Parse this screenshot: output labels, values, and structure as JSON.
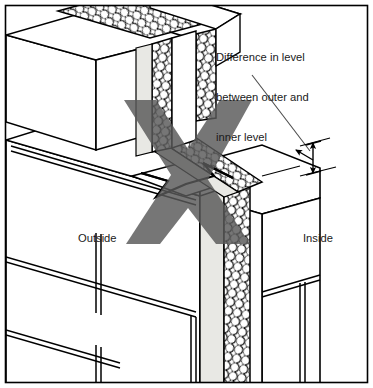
{
  "figure": {
    "width": 373,
    "height": 388,
    "background": "#ffffff",
    "border_color": "#000000",
    "type": "isometric-construction-detail"
  },
  "annotations": {
    "callout": {
      "name": "difference-in-level-callout",
      "lines": [
        "Difference in level",
        "between outer and",
        "inner level"
      ],
      "full_text": "Difference in level between outer and inner level"
    },
    "outside_label": "Outside",
    "inside_label": "Inside"
  },
  "markings": {
    "reject_mark": {
      "glyph": "X",
      "meaning": "incorrect-practice",
      "color": "#595959"
    },
    "dimension_arrow": {
      "name": "level-difference-dimension",
      "orientation": "vertical",
      "style": "double-arrow-with-tick-extensions",
      "color": "#000000"
    },
    "centre_arrow": {
      "name": "level-offset-arrow",
      "orientation": "isometric-horizontal",
      "style": "double-headed",
      "color": "#000000"
    },
    "leader_line": {
      "name": "callout-leader",
      "color": "#4d4d4d"
    }
  },
  "materials": {
    "masonry_fill": "#ffffff",
    "outline": "#000000",
    "cavity_fill": "#e8e8e4",
    "insulation_fill": "#ffffff",
    "insulation_hatch": "#000000",
    "insulation_pattern": "squiggle-loop-hatch",
    "mortar_joint_color": "#000000"
  },
  "layers": [
    {
      "name": "outer-leaf",
      "position": "outside"
    },
    {
      "name": "cavity",
      "position": "middle"
    },
    {
      "name": "insulation",
      "position": "middle"
    },
    {
      "name": "inner-leaf",
      "position": "inside"
    }
  ]
}
